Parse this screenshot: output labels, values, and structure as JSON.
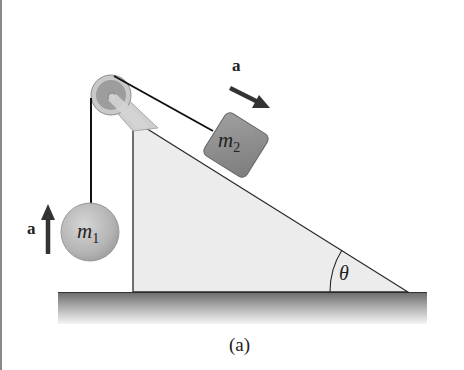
{
  "figure": {
    "caption": "(a)",
    "mass_hanging": {
      "symbol": "m",
      "subscript": "1"
    },
    "mass_incline": {
      "symbol": "m",
      "subscript": "2"
    },
    "accel_label_m1": "a",
    "accel_label_m2": "a",
    "angle_label": "θ",
    "colors": {
      "wedge_fill": "#ebebeb",
      "ground_top": "#707070",
      "ground_bottom": "#f4f4f4",
      "block_fill": "#8c8c8c",
      "ball_fill": "#bdbdbd",
      "rope": "#111111",
      "arrow": "#333333",
      "pulley_outer": "#c4c4c4",
      "pulley_inner": "#9a9a9a"
    }
  }
}
